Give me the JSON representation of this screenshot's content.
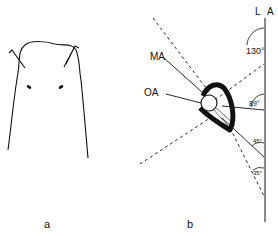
{
  "panel_a": {
    "label": "a",
    "description": "dorsal outline of animal head with two tentacles and two eyes"
  },
  "panel_b": {
    "label": "b",
    "axis_labels": {
      "left": "L",
      "right": "A"
    },
    "line_labels": {
      "ma": "MA",
      "oa": "OA"
    },
    "angles": [
      "130°",
      "89°",
      "45°",
      "35°"
    ]
  },
  "colors": {
    "ink": "#111111",
    "background": "#ffffff"
  }
}
